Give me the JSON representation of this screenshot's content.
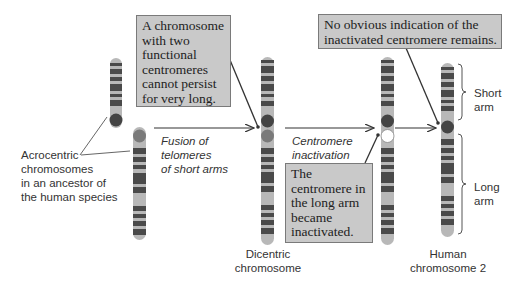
{
  "diagram": {
    "colors": {
      "band_dark": "#4a4a4a",
      "band_light": "#b8b8b8",
      "centromere_active": "#444444",
      "centromere_secondary": "#7a7a7a",
      "centromere_inactive": "#ffffff",
      "note_fill": "#c9c9c9",
      "note_border": "#7a7a7a",
      "arrow": "#333333"
    },
    "notes": {
      "dicentric": "A chromosome\nwith two\nfunctional\ncentromeres\ncannot persist\nfor very long.",
      "no_indication": "No obvious indication of the\ninactivated centromere remains.",
      "inactivated": "The\ncentromere in\nthe long arm\nbecame\ninactivated."
    },
    "labels": {
      "acrocentric": "Acrocentric\nchromosomes\nin an ancestor of\nthe human species",
      "fusion_step": "Fusion of\ntelomeres\nof short arms",
      "inactivation_step": "Centromere\ninactivation",
      "dicentric": "Dicentric\nchromosome",
      "human_chr2": "Human\nchromosome 2",
      "short_arm": "Short\narm",
      "long_arm": "Long\narm"
    },
    "stages": [
      {
        "name": "acrocentric-chromosomes",
        "label": "Acrocentric chromosomes in an ancestor of the human species"
      },
      {
        "name": "dicentric-chromosome",
        "label": "Dicentric chromosome"
      },
      {
        "name": "inactivated-centromere",
        "label": "Centromere inactivation"
      },
      {
        "name": "human-chromosome-2",
        "label": "Human chromosome 2"
      }
    ]
  }
}
